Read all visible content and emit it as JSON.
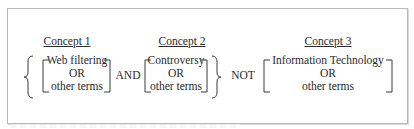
{
  "diagram": {
    "type": "boolean-search-query",
    "concepts": [
      {
        "heading": "Concept 1",
        "term": "Web filtering",
        "connector": "OR",
        "other": "other terms"
      },
      {
        "heading": "Concept 2",
        "term": "Controversy",
        "connector": "OR",
        "other": "other terms"
      },
      {
        "heading": "Concept 3",
        "term": "Information Technology",
        "connector": "OR",
        "other": "other terms"
      }
    ],
    "operators": [
      "AND",
      "NOT"
    ],
    "colors": {
      "ink": "#2a2a2a",
      "frame": "#b8b8b8",
      "background": "#ffffff"
    }
  }
}
